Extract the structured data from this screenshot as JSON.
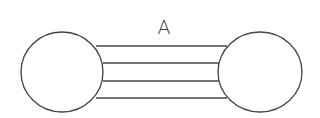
{
  "diagram": {
    "label": "A",
    "stroke_color": "#444444",
    "nodes": [
      {
        "id": "left-circle",
        "cx": 62,
        "cy": 72,
        "rx": 41,
        "ry": 40
      },
      {
        "id": "right-circle",
        "cx": 260,
        "cy": 72,
        "rx": 42,
        "ry": 40
      }
    ],
    "bonds": [
      {
        "y": 46,
        "x1": 96,
        "x2": 227
      },
      {
        "y": 63,
        "x1": 103,
        "x2": 219
      },
      {
        "y": 81,
        "x1": 103,
        "x2": 219
      },
      {
        "y": 98,
        "x1": 96,
        "x2": 227
      }
    ]
  }
}
